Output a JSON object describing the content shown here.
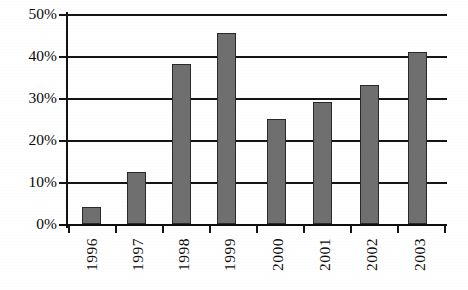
{
  "chart_data": {
    "type": "bar",
    "title": "",
    "subtitle": "",
    "xlabel": "",
    "ylabel": "",
    "categories": [
      "1996",
      "1997",
      "1998",
      "1999",
      "2000",
      "2001",
      "2002",
      "2003"
    ],
    "values": [
      4,
      12.5,
      38,
      45.5,
      25,
      29,
      33,
      41
    ],
    "value_labels": [
      "4%",
      "12.5%",
      "38%",
      "45.5%",
      "25%",
      "29%",
      "33%",
      "41%"
    ],
    "ylim": [
      0,
      50
    ],
    "ytick_values": [
      0,
      10,
      20,
      30,
      40,
      50
    ],
    "ytick_labels": [
      "0%",
      "10%",
      "20%",
      "30%",
      "40%",
      "50%"
    ],
    "grid": true,
    "grid_axis": "y",
    "legend": false,
    "legend_position": "none",
    "series": [
      {
        "name": "",
        "values": [
          4,
          12.5,
          38,
          45.5,
          25,
          29,
          33,
          41
        ]
      }
    ],
    "colors": {
      "bar_fill": "#6f6f6f",
      "bar_border": "#2a2a2a",
      "axis": "#0d0d0d",
      "grid": "#151515",
      "text": "#0a0a0a",
      "background": "#ffffff"
    }
  },
  "axes": {
    "y_ticks": [
      {
        "label": "50%",
        "value": 50
      },
      {
        "label": "40%",
        "value": 40
      },
      {
        "label": "30%",
        "value": 30
      },
      {
        "label": "20%",
        "value": 20
      },
      {
        "label": "10%",
        "value": 10
      },
      {
        "label": "0%",
        "value": 0
      }
    ],
    "x_ticks": [
      {
        "label": "1996"
      },
      {
        "label": "1997"
      },
      {
        "label": "1998"
      },
      {
        "label": "1999"
      },
      {
        "label": "2000"
      },
      {
        "label": "2001"
      },
      {
        "label": "2002"
      },
      {
        "label": "2003"
      }
    ]
  }
}
